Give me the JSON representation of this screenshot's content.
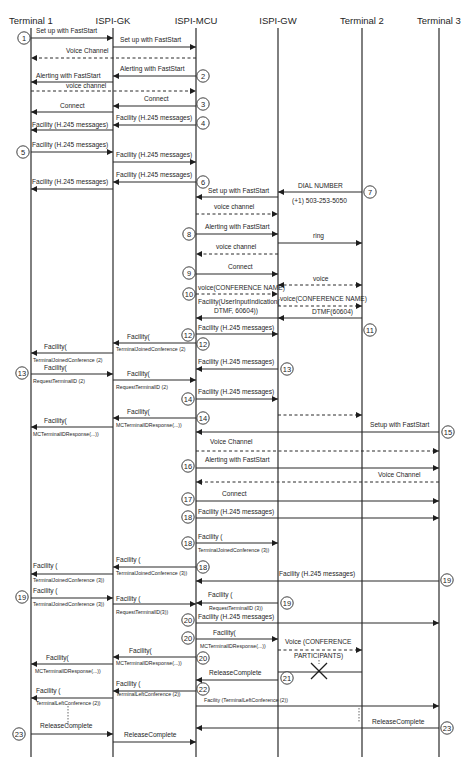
{
  "diagram": {
    "participants": [
      {
        "id": "T1",
        "label": "Terminal 1",
        "x": 31
      },
      {
        "id": "GK",
        "label": "ISPI-GK",
        "x": 113
      },
      {
        "id": "MCU",
        "label": "ISPI-MCU",
        "x": 196
      },
      {
        "id": "GW",
        "label": "ISPI-GW",
        "x": 278
      },
      {
        "id": "T2",
        "label": "Terminal 2",
        "x": 362
      },
      {
        "id": "T3",
        "label": "Terminal 3",
        "x": 439
      }
    ],
    "messages": [
      {
        "from": "T1",
        "to": "GK",
        "y": 38,
        "label": "Set up with FastStart",
        "lx": 36,
        "ly": 33
      },
      {
        "from": "GK",
        "to": "MCU",
        "y": 47,
        "label": "Set up with FastStart",
        "lx": 120,
        "ly": 42
      },
      {
        "from": "MCU",
        "to": "T1",
        "y": 58,
        "dashed": true,
        "label": "Voice Channel",
        "lx": 66,
        "ly": 53
      },
      {
        "from": "MCU",
        "to": "GK",
        "y": 76,
        "label": "Alerting with FastStart",
        "lx": 120,
        "ly": 71
      },
      {
        "from": "GK",
        "to": "T1",
        "y": 82,
        "label": "Alerting with FastStart",
        "lx": 36,
        "ly": 78
      },
      {
        "from": "T1",
        "to": "MCU",
        "y": 91,
        "dashed": true,
        "label": "voice channel",
        "lx": 66,
        "ly": 88
      },
      {
        "from": "MCU",
        "to": "GK",
        "y": 106,
        "label": "Connect",
        "lx": 144,
        "ly": 101
      },
      {
        "from": "GK",
        "to": "T1",
        "y": 112,
        "label": "Connect",
        "lx": 60,
        "ly": 108
      },
      {
        "from": "MCU",
        "to": "GK",
        "y": 125,
        "label": "Facility (H.245 messages)",
        "lx": 116,
        "ly": 120
      },
      {
        "from": "GK",
        "to": "T1",
        "y": 130,
        "label": "Facility (H.245 messages)",
        "lx": 32,
        "ly": 127
      },
      {
        "from": "T1",
        "to": "GK",
        "y": 152,
        "label": "Facility (H.245 messages)",
        "lx": 32,
        "ly": 147
      },
      {
        "from": "GK",
        "to": "MCU",
        "y": 162,
        "label": "Facility (H.245 messages)",
        "lx": 116,
        "ly": 157
      },
      {
        "from": "MCU",
        "to": "GK",
        "y": 182,
        "label": "Facility (H.245 messages)",
        "lx": 116,
        "ly": 177
      },
      {
        "from": "GK",
        "to": "T1",
        "y": 189,
        "label": "Facility (H.245 messages)",
        "lx": 32,
        "ly": 184
      },
      {
        "from": "T2",
        "to": "GW",
        "y": 192,
        "label": "DIAL NUMBER",
        "lx": 298,
        "ly": 188,
        "label2": "(+1) 503-253-5050",
        "l2x": 292,
        "l2y": 203
      },
      {
        "from": "GW",
        "to": "MCU",
        "y": 197,
        "label": "Set up with FastStart",
        "lx": 208,
        "ly": 193
      },
      {
        "from": "MCU",
        "to": "GW",
        "y": 214,
        "dashed": true,
        "label": "voice channel",
        "lx": 214,
        "ly": 209
      },
      {
        "from": "MCU",
        "to": "GW",
        "y": 234,
        "label": "Alerting with FastStart",
        "lx": 205,
        "ly": 229
      },
      {
        "from": "GW",
        "to": "T2",
        "y": 243,
        "label": "ring",
        "lx": 313,
        "ly": 238
      },
      {
        "from": "GW",
        "to": "MCU",
        "y": 254,
        "dashed": true,
        "label": "voice channel",
        "lx": 216,
        "ly": 249
      },
      {
        "from": "MCU",
        "to": "GW",
        "y": 274,
        "label": "Connect",
        "lx": 228,
        "ly": 269
      },
      {
        "from": "GW",
        "to": "T2",
        "y": 285,
        "dashed": true,
        "bidir": true,
        "label": "voice",
        "lx": 313,
        "ly": 281
      },
      {
        "from": "MCU",
        "to": "GW",
        "y": 294,
        "dashed": true,
        "label": "voice(CONFERENCE NAME)",
        "lx": 198,
        "ly": 290
      },
      {
        "from": "GW",
        "to": "T2",
        "y": 306,
        "dashed": true,
        "label": "voice(CONFERENCE NAME)",
        "lx": 280,
        "ly": 301
      },
      {
        "from": "T2",
        "to": "GW",
        "y": 318,
        "label": "DTMF(60604)",
        "lx": 312,
        "ly": 314
      },
      {
        "from": "GW",
        "to": "MCU",
        "y": 318,
        "label": "Facility(UserInputIndication(",
        "lx": 198,
        "ly": 304,
        "label2": "DTMF, 60604))",
        "l2x": 214,
        "l2y": 313
      },
      {
        "from": "MCU",
        "to": "GW",
        "y": 334,
        "label": "Facility (H.245 messages)",
        "lx": 198,
        "ly": 330
      },
      {
        "from": "MCU",
        "to": "GK",
        "y": 343,
        "label": "Facility(",
        "lx": 127,
        "ly": 339,
        "sub": "TerminalJoinedConference (2)",
        "sx": 116,
        "sy": 351
      },
      {
        "from": "GK",
        "to": "T1",
        "y": 353,
        "label": "Facility(",
        "lx": 44,
        "ly": 349,
        "sub": "TerminalJoinedConference (2)",
        "sx": 33,
        "sy": 362
      },
      {
        "from": "GW",
        "to": "MCU",
        "y": 369,
        "label": "Facility (H.245 messages)",
        "lx": 198,
        "ly": 364
      },
      {
        "from": "T1",
        "to": "GK",
        "y": 374,
        "label": "Facility(",
        "lx": 44,
        "ly": 370,
        "sub": "RequestTerminalID (2)",
        "sx": 33,
        "sy": 383
      },
      {
        "from": "GK",
        "to": "MCU",
        "y": 380,
        "label": "Facility(",
        "lx": 127,
        "ly": 376,
        "sub": "RequestTerminalID (2)",
        "sx": 116,
        "sy": 389
      },
      {
        "from": "MCU",
        "to": "GW",
        "y": 399,
        "label": "Facility (H.245 messages)",
        "lx": 198,
        "ly": 394
      },
      {
        "from": "MCU",
        "to": "GK",
        "y": 418,
        "label": "Facility(",
        "lx": 127,
        "ly": 414,
        "sub": "MCTerminalIDResponse(...))",
        "sx": 116,
        "sy": 427
      },
      {
        "from": "GK",
        "to": "T1",
        "y": 427,
        "label": "Facility(",
        "lx": 44,
        "ly": 423,
        "sub": "MCTerminalIDResponse(...))",
        "sx": 33,
        "sy": 436
      },
      {
        "from": "GW",
        "to": "T2",
        "y": 415,
        "dashed": true,
        "label": "",
        "lx": 0,
        "ly": 0
      },
      {
        "from": "T3",
        "to": "MCU",
        "y": 432,
        "label": "Setup with FastStart",
        "lx": 370,
        "ly": 427
      },
      {
        "from": "MCU",
        "to": "T3",
        "y": 451,
        "dashed": true,
        "label": "Voice Channel",
        "lx": 210,
        "ly": 444
      },
      {
        "from": "MCU",
        "to": "T3",
        "y": 468,
        "label": "Alerting with FastStart",
        "lx": 205,
        "ly": 462
      },
      {
        "from": "T3",
        "to": "MCU",
        "y": 482,
        "dashed": true,
        "label": "Voice Channel",
        "lx": 378,
        "ly": 477
      },
      {
        "from": "MCU",
        "to": "T3",
        "y": 501,
        "label": "Connect",
        "lx": 222,
        "ly": 496
      },
      {
        "from": "MCU",
        "to": "T3",
        "y": 518,
        "label": "Facility (H.245 messages)",
        "lx": 198,
        "ly": 514
      },
      {
        "from": "MCU",
        "to": "GW",
        "y": 543,
        "label": "Facility (",
        "lx": 198,
        "ly": 539,
        "sub": "TerminalJoinedConference (3))",
        "sx": 198,
        "sy": 552
      },
      {
        "from": "MCU",
        "to": "GK",
        "y": 567,
        "label": "Facility (",
        "lx": 116,
        "ly": 562,
        "sub": "TerminalJoinedConference (3))",
        "sx": 116,
        "sy": 575
      },
      {
        "from": "GK",
        "to": "T1",
        "y": 574,
        "label": "Facility (",
        "lx": 33,
        "ly": 568,
        "sub": "TerminalJoinedConference (3))",
        "sx": 33,
        "sy": 582
      },
      {
        "from": "T3",
        "to": "MCU",
        "y": 581,
        "label": "Facility (H.245 messages)",
        "lx": 279,
        "ly": 576
      },
      {
        "from": "T1",
        "to": "GK",
        "y": 598,
        "label": "Facility (",
        "lx": 33,
        "ly": 593,
        "sub": "TerminalJoinedConference (3))",
        "sx": 33,
        "sy": 606
      },
      {
        "from": "GK",
        "to": "MCU",
        "y": 604,
        "label": "Facility (",
        "lx": 116,
        "ly": 601,
        "sub": "RequestTerminalID(3))",
        "sx": 116,
        "sy": 614
      },
      {
        "from": "GW",
        "to": "MCU",
        "y": 603,
        "label": "Facility (",
        "lx": 208,
        "ly": 597,
        "sub": "RequestTerminalID (3))",
        "sx": 209,
        "sy": 610
      },
      {
        "from": "MCU",
        "to": "T3",
        "y": 623,
        "label": "Facility (H.245 messages)",
        "lx": 198,
        "ly": 619
      },
      {
        "from": "MCU",
        "to": "GW",
        "y": 639,
        "label": "Facility(",
        "lx": 213,
        "ly": 635,
        "sub": "MCTerminalIDResponse(...))",
        "sx": 200,
        "sy": 648
      },
      {
        "from": "GW",
        "to": "T2",
        "y": 650,
        "dashed": true,
        "label": "Voice (CONFERENCE",
        "lx": 285,
        "ly": 644,
        "label2": "PARTICIPANTS)",
        "l2x": 294,
        "l2y": 658
      },
      {
        "from": "MCU",
        "to": "GK",
        "y": 657,
        "label": "Facility(",
        "lx": 129,
        "ly": 653,
        "sub": "MCTerminalIDResponse(...))",
        "sx": 116,
        "sy": 665
      },
      {
        "from": "GK",
        "to": "T1",
        "y": 664,
        "label": "Facility(",
        "lx": 46,
        "ly": 660,
        "sub": "MCTerminalIDResponse(...))",
        "sx": 35,
        "sy": 673
      },
      {
        "from": "T2",
        "to": "GW",
        "y": 672,
        "label": "",
        "lx": 0,
        "ly": 0,
        "noarrow": true
      },
      {
        "from": "GW",
        "to": "MCU",
        "y": 680,
        "label": "ReleaseComplete",
        "lx": 209,
        "ly": 675
      },
      {
        "from": "MCU",
        "to": "GK",
        "y": 691,
        "label": "Facility (",
        "lx": 116,
        "ly": 686,
        "sub": "TerminalLeftConference (2))",
        "sx": 116,
        "sy": 696
      },
      {
        "from": "GK",
        "to": "T1",
        "y": 698,
        "label": "Facility (",
        "lx": 36,
        "ly": 693,
        "sub": "TerminalLeftConference (2))",
        "sx": 36,
        "sy": 705
      },
      {
        "from": "MCU",
        "to": "T3",
        "y": 706,
        "label": "Facility (TerminalLeftConference (2))",
        "lx": 204,
        "ly": 702,
        "small": true
      },
      {
        "from": "T3",
        "to": "MCU",
        "y": 728,
        "label": "ReleaseComplete",
        "lx": 372,
        "ly": 724
      },
      {
        "from": "T1",
        "to": "GK",
        "y": 734,
        "label": "ReleaseComplete",
        "lx": 40,
        "ly": 728
      },
      {
        "from": "GK",
        "to": "MCU",
        "y": 742,
        "label": "ReleaseComplete",
        "lx": 124,
        "ly": 737
      }
    ],
    "steps": [
      {
        "n": "1",
        "x": 24,
        "y": 38
      },
      {
        "n": "2",
        "x": 203,
        "y": 76
      },
      {
        "n": "3",
        "x": 203,
        "y": 104
      },
      {
        "n": "4",
        "x": 203,
        "y": 123
      },
      {
        "n": "5",
        "x": 23,
        "y": 152
      },
      {
        "n": "6",
        "x": 203,
        "y": 182
      },
      {
        "n": "7",
        "x": 370,
        "y": 192
      },
      {
        "n": "8",
        "x": 189,
        "y": 234
      },
      {
        "n": "9",
        "x": 189,
        "y": 273
      },
      {
        "n": "10",
        "x": 189,
        "y": 294
      },
      {
        "n": "11",
        "x": 370,
        "y": 330
      },
      {
        "n": "12",
        "x": 188,
        "y": 335
      },
      {
        "n": "12",
        "x": 203,
        "y": 344
      },
      {
        "n": "13",
        "x": 22,
        "y": 373
      },
      {
        "n": "13",
        "x": 287,
        "y": 369
      },
      {
        "n": "14",
        "x": 188,
        "y": 399
      },
      {
        "n": "14",
        "x": 203,
        "y": 418
      },
      {
        "n": "15",
        "x": 448,
        "y": 432
      },
      {
        "n": "16",
        "x": 188,
        "y": 466
      },
      {
        "n": "17",
        "x": 188,
        "y": 499
      },
      {
        "n": "18",
        "x": 188,
        "y": 517
      },
      {
        "n": "18",
        "x": 188,
        "y": 543
      },
      {
        "n": "18",
        "x": 203,
        "y": 567
      },
      {
        "n": "19",
        "x": 447,
        "y": 580
      },
      {
        "n": "19",
        "x": 22,
        "y": 597
      },
      {
        "n": "19",
        "x": 287,
        "y": 603
      },
      {
        "n": "20",
        "x": 188,
        "y": 620
      },
      {
        "n": "20",
        "x": 188,
        "y": 638
      },
      {
        "n": "20",
        "x": 203,
        "y": 658
      },
      {
        "n": "21",
        "x": 287,
        "y": 678
      },
      {
        "n": "22",
        "x": 203,
        "y": 689
      },
      {
        "n": "23",
        "x": 447,
        "y": 728
      },
      {
        "n": "23",
        "x": 19,
        "y": 734
      }
    ],
    "crosses": [
      {
        "x": 319,
        "y": 671,
        "size": 8
      }
    ],
    "dotted_connectors": [
      {
        "x": 68,
        "y1": 706,
        "y2": 726
      },
      {
        "x": 359,
        "y1": 708,
        "y2": 722
      },
      {
        "x": 319,
        "y1": 660,
        "y2": 664
      }
    ],
    "colors": {
      "line": "#2a2a2a",
      "text": "#1e1e1e",
      "background": "#ffffff"
    }
  }
}
